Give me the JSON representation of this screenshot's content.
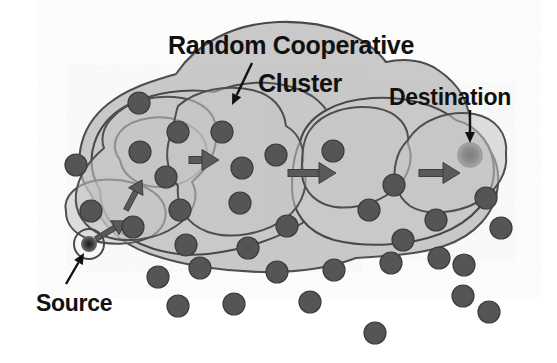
{
  "figure": {
    "title_line1": "Random Cooperative",
    "title_line2": "Cluster",
    "destination_label": "Destination",
    "source_label": "Source",
    "background_color": "#ffffff",
    "region_fill": "#c9c9c9",
    "region_stroke": "#4a4a4a",
    "cluster_fill": "#c4c4c4",
    "cluster_stroke": "#4f4f4f",
    "node_color": "#555555",
    "node_stroke": "#3c3c3c",
    "destination_node_color": "#8c8c8c",
    "source_node_color": "#3a3a3a",
    "arrow_color": "#5a5a5a",
    "pointer_color": "#111111",
    "text_color": "#111111"
  },
  "regions": [
    {
      "id": "outer-network-region",
      "name": "outer-network-region",
      "path": "M 92 196 C 70 168 78 128 108 104 C 128 88 150 82 176 74 C 196 44 232 24 278 22 C 330 20 368 38 386 62 C 404 58 424 60 438 70 C 462 86 472 108 470 134 C 488 142 500 160 498 184 C 496 214 474 236 444 246 C 420 254 390 256 356 258 C 330 268 300 272 268 272 C 228 272 184 266 150 254 C 118 243 98 222 92 196 Z"
    },
    {
      "id": "left-mid-region",
      "name": "left-mid-region",
      "path": "M 100 190 C 82 160 94 124 126 106 C 152 92 186 88 214 92 C 248 78 286 80 312 96 C 330 108 338 128 336 150 C 342 176 330 204 304 222 C 280 238 244 250 208 254 C 170 258 132 246 112 224 C 104 214 100 202 100 190 Z"
    },
    {
      "id": "right-region",
      "name": "right-region",
      "path": "M 300 142 C 306 116 336 100 372 98 C 404 96 436 104 456 120 C 478 126 494 146 494 170 C 494 198 472 222 440 234 C 408 246 366 248 334 240 C 306 232 292 212 292 188 C 292 170 294 154 300 142 Z"
    }
  ],
  "clusters": [
    {
      "id": "cluster-left-inner-a",
      "name": "cooperative-cluster-left-upper",
      "path": "M 120 160 C 108 144 118 126 140 120 C 160 114 182 118 196 130 C 208 140 210 156 202 168 C 192 182 170 190 148 186 C 132 182 122 172 120 160 Z"
    },
    {
      "id": "cluster-left-inner-b",
      "name": "cooperative-cluster-left-lower",
      "path": "M 66 212 C 62 196 78 182 100 180 C 122 178 146 184 158 196 C 170 208 168 226 152 236 C 134 246 106 246 86 238 C 72 232 66 222 66 212 Z"
    },
    {
      "id": "cluster-left-outer",
      "name": "cooperative-cluster-left-outer",
      "path": "M 112 118 C 128 100 156 94 182 98 C 204 102 216 114 216 130 C 218 150 208 168 192 182 C 200 196 194 214 176 226 C 156 240 126 244 104 236 C 84 228 74 212 76 194 C 78 176 90 160 104 148 C 100 138 104 126 112 118 Z"
    },
    {
      "id": "cluster-center",
      "name": "cooperative-cluster-center",
      "path": "M 178 106 C 196 90 226 84 252 90 C 272 94 284 108 286 126 C 300 134 306 150 302 166 C 310 182 304 204 286 218 C 264 234 232 240 208 232 C 186 224 176 206 178 186 C 166 172 164 150 172 132 C 174 122 176 112 178 106 Z"
    },
    {
      "id": "cluster-right-mid",
      "name": "cooperative-cluster-right-mid",
      "path": "M 310 130 C 322 112 350 104 376 108 C 398 112 410 126 408 144 C 414 158 410 176 394 190 C 374 206 344 212 324 204 C 306 196 300 180 302 164 C 302 150 304 138 310 130 Z"
    },
    {
      "id": "cluster-right-dest",
      "name": "cooperative-cluster-destination",
      "path": "M 408 140 C 420 120 448 110 474 114 C 496 118 508 134 506 154 C 508 172 498 190 478 202 C 456 214 426 216 410 206 C 396 196 392 178 396 162 C 398 152 402 146 408 140 Z"
    }
  ],
  "nodes_in_clusters": [
    {
      "name": "node-left-upper-1",
      "cx": 139,
      "cy": 103,
      "r": 11
    },
    {
      "name": "node-left-upper-2",
      "cx": 178,
      "cy": 132,
      "r": 11
    },
    {
      "name": "node-left-upper-3",
      "cx": 222,
      "cy": 132,
      "r": 11
    },
    {
      "name": "node-left-mid-1",
      "cx": 76,
      "cy": 165,
      "r": 11
    },
    {
      "name": "node-left-mid-2",
      "cx": 140,
      "cy": 152,
      "r": 11
    },
    {
      "name": "node-left-mid-3",
      "cx": 166,
      "cy": 177,
      "r": 11
    },
    {
      "name": "node-left-low-1",
      "cx": 91,
      "cy": 211,
      "r": 11
    },
    {
      "name": "node-left-low-2",
      "cx": 133,
      "cy": 227,
      "r": 11
    },
    {
      "name": "node-left-low-3",
      "cx": 180,
      "cy": 210,
      "r": 11
    },
    {
      "name": "node-left-low-4",
      "cx": 186,
      "cy": 245,
      "r": 11
    },
    {
      "name": "node-left-bottom-1",
      "cx": 158,
      "cy": 277,
      "r": 11
    },
    {
      "name": "node-center-1",
      "cx": 242,
      "cy": 168,
      "r": 11
    },
    {
      "name": "node-center-2",
      "cx": 240,
      "cy": 203,
      "r": 11
    },
    {
      "name": "node-center-3",
      "cx": 248,
      "cy": 248,
      "r": 11
    },
    {
      "name": "node-center-4",
      "cx": 277,
      "cy": 272,
      "r": 11
    },
    {
      "name": "node-center-5",
      "cx": 276,
      "cy": 155,
      "r": 11
    },
    {
      "name": "node-center-6",
      "cx": 287,
      "cy": 226,
      "r": 11
    },
    {
      "name": "node-right-mid-1",
      "cx": 333,
      "cy": 151,
      "r": 11
    },
    {
      "name": "node-right-mid-2",
      "cx": 394,
      "cy": 185,
      "r": 11
    },
    {
      "name": "node-right-mid-3",
      "cx": 369,
      "cy": 210,
      "r": 11
    },
    {
      "name": "node-right-mid-4",
      "cx": 403,
      "cy": 240,
      "r": 11
    },
    {
      "name": "node-right-dest-1",
      "cx": 436,
      "cy": 220,
      "r": 11
    },
    {
      "name": "node-right-dest-2",
      "cx": 486,
      "cy": 198,
      "r": 11
    },
    {
      "name": "node-right-dest-3",
      "cx": 439,
      "cy": 258,
      "r": 11
    },
    {
      "name": "node-right-edge-1",
      "cx": 501,
      "cy": 228,
      "r": 11
    }
  ],
  "nodes_outside": [
    {
      "name": "node-outside-1",
      "cx": 200,
      "cy": 268,
      "r": 11
    },
    {
      "name": "node-outside-2",
      "cx": 334,
      "cy": 270,
      "r": 11
    },
    {
      "name": "node-outside-3",
      "cx": 391,
      "cy": 263,
      "r": 11
    },
    {
      "name": "node-outside-4",
      "cx": 464,
      "cy": 265,
      "r": 11
    },
    {
      "name": "node-outside-5",
      "cx": 178,
      "cy": 306,
      "r": 11
    },
    {
      "name": "node-outside-6",
      "cx": 234,
      "cy": 304,
      "r": 11
    },
    {
      "name": "node-outside-7",
      "cx": 310,
      "cy": 302,
      "r": 11
    },
    {
      "name": "node-outside-8",
      "cx": 463,
      "cy": 296,
      "r": 11
    },
    {
      "name": "node-outside-9",
      "cx": 489,
      "cy": 312,
      "r": 11
    },
    {
      "name": "node-outside-10",
      "cx": 375,
      "cy": 333,
      "r": 11
    }
  ],
  "special_nodes": {
    "source": {
      "name": "source-node",
      "cx": 89,
      "cy": 244,
      "r": 8,
      "ring_r": 15
    },
    "destination": {
      "name": "destination-node",
      "cx": 470,
      "cy": 155,
      "r": 12
    }
  },
  "hop_arrows": [
    {
      "name": "hop-arrow-1",
      "x1": 189,
      "y1": 160,
      "x2": 219,
      "y2": 160
    },
    {
      "name": "hop-arrow-2",
      "x1": 288,
      "y1": 173,
      "x2": 336,
      "y2": 173
    },
    {
      "name": "hop-arrow-3",
      "x1": 419,
      "y1": 173,
      "x2": 460,
      "y2": 173
    }
  ],
  "local_arrows": [
    {
      "name": "local-arrow-source-to-node",
      "x1": 96,
      "y1": 239,
      "x2": 126,
      "y2": 221
    },
    {
      "name": "local-arrow-node-to-node",
      "x1": 126,
      "y1": 210,
      "x2": 142,
      "y2": 180
    }
  ],
  "pointers": [
    {
      "name": "cluster-pointer-arrow",
      "x1": 252,
      "y1": 63,
      "x2": 232,
      "y2": 105
    },
    {
      "name": "destination-pointer-arrow",
      "x1": 470,
      "y1": 110,
      "x2": 470,
      "y2": 143
    },
    {
      "name": "source-pointer-arrow",
      "x1": 66,
      "y1": 284,
      "x2": 84,
      "y2": 253
    }
  ],
  "label_positions": {
    "title_line1": {
      "x": 168,
      "y": 54
    },
    "title_line2": {
      "x": 258,
      "y": 92
    },
    "destination": {
      "x": 389,
      "y": 105
    },
    "source": {
      "x": 36,
      "y": 311
    }
  }
}
